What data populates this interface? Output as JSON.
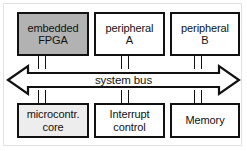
{
  "diagram": {
    "background_color": "#ffffff",
    "line_color": "#111111",
    "frame_color": "#e2e2e2"
  },
  "bus": {
    "label": "system bus",
    "style": "double-headed-arrow",
    "fill_color": "#ffffff",
    "left_arrow_name": "bus-arrow-left",
    "right_arrow_name": "bus-arrow-right"
  },
  "top_row": [
    {
      "id": "embedded-fpga",
      "label": "embedded\nFPGA",
      "fill_color": "#b2b2b2"
    },
    {
      "id": "peripheral-a",
      "label": "peripheral\nA",
      "fill_color": "#ffffff"
    },
    {
      "id": "peripheral-b",
      "label": "peripheral\nB",
      "fill_color": "#ffffff"
    }
  ],
  "bottom_row": [
    {
      "id": "microcontroller-core",
      "label": "microcontr.\ncore",
      "fill_color": "#ededed"
    },
    {
      "id": "interrupt-control",
      "label": "Interrupt\ncontrol",
      "fill_color": "#ffffff"
    },
    {
      "id": "memory",
      "label": "Memory",
      "fill_color": "#ffffff"
    }
  ],
  "connectors": [
    {
      "id": "connector-embedded-fpga-to-bus",
      "from": "embedded-fpga",
      "to": "system-bus"
    },
    {
      "id": "connector-peripheral-a-to-bus",
      "from": "peripheral-a",
      "to": "system-bus"
    },
    {
      "id": "connector-peripheral-b-to-bus",
      "from": "peripheral-b",
      "to": "system-bus"
    },
    {
      "id": "connector-bus-to-microcontroller-core",
      "from": "system-bus",
      "to": "microcontroller-core"
    },
    {
      "id": "connector-bus-to-interrupt-control",
      "from": "system-bus",
      "to": "interrupt-control"
    },
    {
      "id": "connector-bus-to-memory",
      "from": "system-bus",
      "to": "memory"
    }
  ]
}
